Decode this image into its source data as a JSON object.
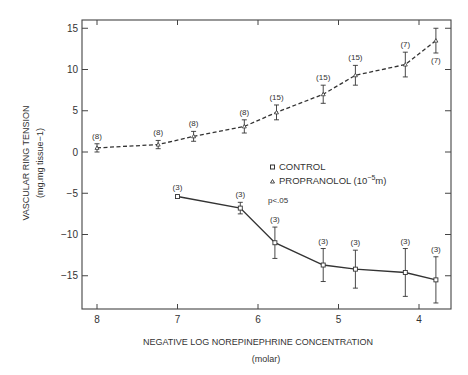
{
  "chart_data": {
    "type": "line",
    "title": "",
    "xlabel": "NEGATIVE LOG NOREPINEPHRINE CONCENTRATION",
    "xlabel_sub": "(molar)",
    "ylabel": "VASCULAR RING TENSION",
    "ylabel_sub": "(mg.mg tissue−1)",
    "xlim": [
      8.2,
      3.6
    ],
    "ylim": [
      -18.5,
      16.5
    ],
    "x_ticks": [
      8,
      7,
      6,
      5,
      4
    ],
    "y_ticks": [
      15,
      10,
      5,
      0,
      -5,
      -10,
      -15
    ],
    "grid": false,
    "legend": {
      "position": "center-right",
      "entries": [
        {
          "label": "CONTROL",
          "marker": "square"
        },
        {
          "label": "PROPRANOLOL (10−5m)",
          "marker": "triangle"
        }
      ]
    },
    "annotations": [
      {
        "text": "p<.05",
        "x": 5.8,
        "y": -3.8
      }
    ],
    "series": [
      {
        "name": "PROPRANOLOL (10−5m)",
        "style": "dashed",
        "marker": "triangle",
        "x": [
          8.0,
          7.24,
          6.8,
          6.17,
          5.77,
          5.19,
          4.79,
          4.17,
          3.79
        ],
        "y": [
          0.5,
          0.9,
          1.9,
          3.1,
          4.8,
          7.0,
          9.3,
          10.6,
          13.5
        ],
        "err": [
          0.5,
          0.5,
          0.6,
          0.8,
          0.9,
          1.1,
          1.2,
          1.5,
          1.5
        ],
        "n": [
          "(8)",
          "(8)",
          "(8)",
          "(8)",
          "(15)",
          "(15)",
          "(15)",
          "(7)",
          "(7)"
        ]
      },
      {
        "name": "CONTROL",
        "style": "solid",
        "marker": "square",
        "x": [
          7.0,
          6.22,
          5.79,
          5.19,
          4.79,
          4.17,
          3.79
        ],
        "y": [
          -5.4,
          -6.8,
          -11.0,
          -13.7,
          -14.2,
          -14.6,
          -15.5
        ],
        "err": [
          0,
          0.7,
          1.9,
          2.0,
          2.3,
          2.9,
          2.8
        ],
        "n": [
          "(3)",
          "(3)",
          "(3)",
          "(3)",
          "(3)",
          "(3)",
          "(3)"
        ]
      }
    ]
  }
}
